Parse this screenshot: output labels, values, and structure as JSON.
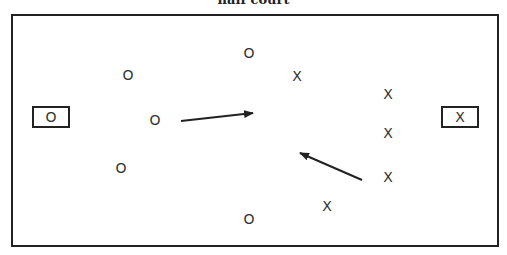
{
  "title": "half court",
  "court": {
    "left": 11,
    "top": 14,
    "right": 497,
    "bottom": 245
  },
  "goals": [
    {
      "name": "left-goal",
      "label": "O",
      "x": 32,
      "y": 106,
      "w": 38,
      "h": 22
    },
    {
      "name": "right-goal",
      "label": "X",
      "x": 441,
      "y": 106,
      "w": 38,
      "h": 22
    }
  ],
  "players": [
    {
      "team": "O",
      "x": 128,
      "y": 75
    },
    {
      "team": "O",
      "x": 249,
      "y": 53
    },
    {
      "team": "O",
      "x": 155,
      "y": 120
    },
    {
      "team": "O",
      "x": 121,
      "y": 168
    },
    {
      "team": "O",
      "x": 249,
      "y": 219
    },
    {
      "team": "X",
      "x": 297,
      "y": 76
    },
    {
      "team": "X",
      "x": 388,
      "y": 94
    },
    {
      "team": "X",
      "x": 388,
      "y": 133
    },
    {
      "team": "X",
      "x": 388,
      "y": 177
    },
    {
      "team": "X",
      "x": 327,
      "y": 206
    }
  ],
  "arrows": [
    {
      "x1": 181,
      "y1": 121,
      "x2": 253,
      "y2": 113
    },
    {
      "x1": 362,
      "y1": 180,
      "x2": 300,
      "y2": 153
    }
  ],
  "colors": {
    "line": "#222222",
    "text": "#333333",
    "background": "#ffffff"
  }
}
